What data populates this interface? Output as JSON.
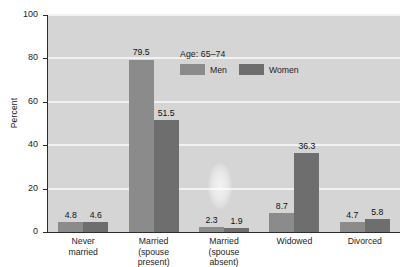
{
  "chart_data": {
    "type": "bar",
    "title": "",
    "subtitle": "",
    "xlabel": "",
    "ylabel": "Percent",
    "ylim": [
      0,
      100
    ],
    "yticks": [
      0,
      20,
      40,
      60,
      80,
      100
    ],
    "grid": "horizontal-white",
    "legend_position": "inside-upper-center",
    "legend_title": "Age: 65–74",
    "categories": [
      "Never\nmarried",
      "Married\n(spouse\npresent)",
      "Married\n(spouse\nabsent)",
      "Widowed",
      "Divorced"
    ],
    "series": [
      {
        "name": "Men",
        "color": "#8b8b8b",
        "values": [
          4.8,
          79.5,
          2.3,
          8.7,
          4.7
        ],
        "labels": [
          "4.8",
          "79.5",
          "2.3",
          "8.7",
          "4.7"
        ]
      },
      {
        "name": "Women",
        "color": "#6e6e6e",
        "values": [
          4.6,
          51.5,
          1.9,
          36.3,
          5.8
        ],
        "labels": [
          "4.6",
          "51.5",
          "1.9",
          "36.3",
          "5.8"
        ]
      }
    ],
    "colors": {
      "panel_background": "#d5d5d5",
      "gridline": "#f2f2f2",
      "axis": "#2c2c2c",
      "men": "#8b8b8b",
      "women": "#6e6e6e",
      "text": "#1d1d1d"
    }
  }
}
